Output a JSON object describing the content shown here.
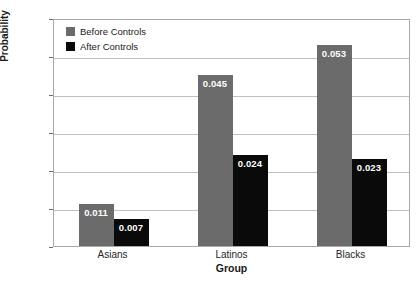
{
  "chart_data": {
    "type": "bar",
    "title": "",
    "xlabel": "Group",
    "ylabel": "Probability",
    "categories": [
      "Asians",
      "Latinos",
      "Blacks"
    ],
    "series": [
      {
        "name": "Before Controls",
        "color": "#6b6b6b",
        "values": [
          0.011,
          0.045,
          0.053
        ],
        "labels": [
          "0.011",
          "0.045",
          "0.053"
        ]
      },
      {
        "name": "After Controls",
        "color": "#0a0a0a",
        "values": [
          0.007,
          0.024,
          0.023
        ],
        "labels": [
          "0.007",
          "0.024",
          "0.023"
        ]
      }
    ],
    "ylim": [
      0,
      0.06
    ],
    "ytick_values": [
      0,
      0.01,
      0.02,
      0.03,
      0.04,
      0.05,
      0.06
    ],
    "ytick_labels": [
      "0",
      "0.01",
      "0.02",
      "0.03",
      "0.04",
      "0.05",
      "0.06"
    ],
    "grid": true,
    "legend_position": "top-left-inside",
    "frame_color": "#a9a9a9",
    "grid_color": "#bfbfbf",
    "background": "#ffffff"
  },
  "legend": {
    "items": [
      {
        "label": "Before Controls",
        "swatch": "before"
      },
      {
        "label": "After Controls",
        "swatch": "after"
      }
    ]
  }
}
